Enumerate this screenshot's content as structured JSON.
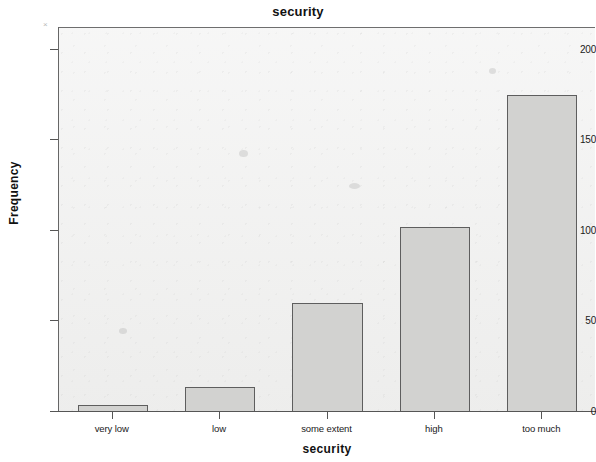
{
  "chart_data": {
    "type": "bar",
    "title": "security",
    "xlabel": "security",
    "ylabel": "Frequency",
    "categories": [
      "very low",
      "low",
      "some extent",
      "high",
      "too much"
    ],
    "values": [
      4,
      14,
      60,
      102,
      175
    ],
    "ylim": [
      0,
      212
    ],
    "yticks": [
      0,
      50,
      100,
      150,
      200
    ],
    "ytick_labels": [
      "0",
      "50",
      "100",
      "150",
      "200"
    ],
    "grid": false,
    "legend": null,
    "bar_fill_color": "#d2d2d0",
    "bar_edge_color": "#5e5e5e",
    "plot_background_color": "#f1f1f0",
    "axis_color": "#555555"
  },
  "figure": {
    "background_color": "#ffffff",
    "corner_mark": "×"
  }
}
